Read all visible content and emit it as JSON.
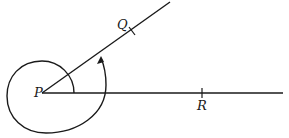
{
  "diagram": {
    "type": "angle-rotation",
    "points": {
      "P": {
        "label": "P",
        "x": 42,
        "y": 93
      },
      "Q": {
        "label": "Q",
        "x": 132,
        "y": 31
      },
      "R": {
        "label": "R",
        "x": 202,
        "y": 93
      }
    },
    "rays": [
      {
        "from": "P",
        "through": "R",
        "end": [
          283,
          93
        ]
      },
      {
        "from": "P",
        "through": "Q",
        "end": [
          170,
          2
        ]
      }
    ],
    "arc": {
      "start_ray": "PR",
      "end_ray": "PQ",
      "direction": "counterclockwise",
      "arrow_at_end": true
    },
    "colors": {
      "line": "#1a1a1a",
      "background": "#ffffff"
    }
  }
}
